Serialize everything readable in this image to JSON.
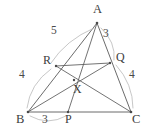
{
  "figure": {
    "stroke_color": "#5a5a5a",
    "arc_color": "#b9b9b9",
    "background": "#ffffff"
  },
  "vertices": {
    "A": {
      "label": "A",
      "x": 97,
      "y": 23
    },
    "B": {
      "label": "B",
      "x": 28,
      "y": 112
    },
    "C": {
      "label": "C",
      "x": 131,
      "y": 112
    }
  },
  "points": {
    "R": {
      "label": "R",
      "x": 56,
      "y": 66
    },
    "Q": {
      "label": "Q",
      "x": 110,
      "y": 63
    },
    "P": {
      "label": "P",
      "x": 68,
      "y": 112
    },
    "X": {
      "label": "X",
      "x": 74,
      "y": 80
    }
  },
  "measures": [
    {
      "name": "AR",
      "value": "5",
      "x": 54,
      "y": 30
    },
    {
      "name": "AQ",
      "value": "3",
      "x": 105,
      "y": 33
    },
    {
      "name": "BR",
      "value": "4",
      "x": 22,
      "y": 74
    },
    {
      "name": "QC",
      "value": "4",
      "x": 131,
      "y": 74
    },
    {
      "name": "BP",
      "value": "3",
      "x": 44,
      "y": 117
    }
  ]
}
